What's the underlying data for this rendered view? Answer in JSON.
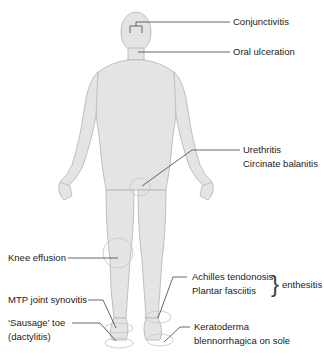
{
  "diagram": {
    "colors": {
      "body_fill": "#e3e3e3",
      "body_stroke": "#b5b5b5",
      "leader_line": "#555555",
      "label_text": "#222222"
    },
    "labels": {
      "conjunctivitis": "Conjunctivitis",
      "oral_ulceration": "Oral ulceration",
      "urethritis": "Urethritis",
      "circinate_balanitis": "Circinate balanitis",
      "knee_effusion": "Knee effusion",
      "achilles_tendonosis": "Achilles tendonosis",
      "plantar_fasciitis": "Plantar fasciitis",
      "enthesitis_brace": "}",
      "enthesitis": "enthesitis",
      "mtp_joint_synovitis": "MTP joint synovitis",
      "sausage_toe": "‘Sausage’ toe",
      "dactylitis": "(dactylitis)",
      "keratoderma": "Keratoderma",
      "blennorrhagica": "blennorrhagica on sole"
    }
  }
}
